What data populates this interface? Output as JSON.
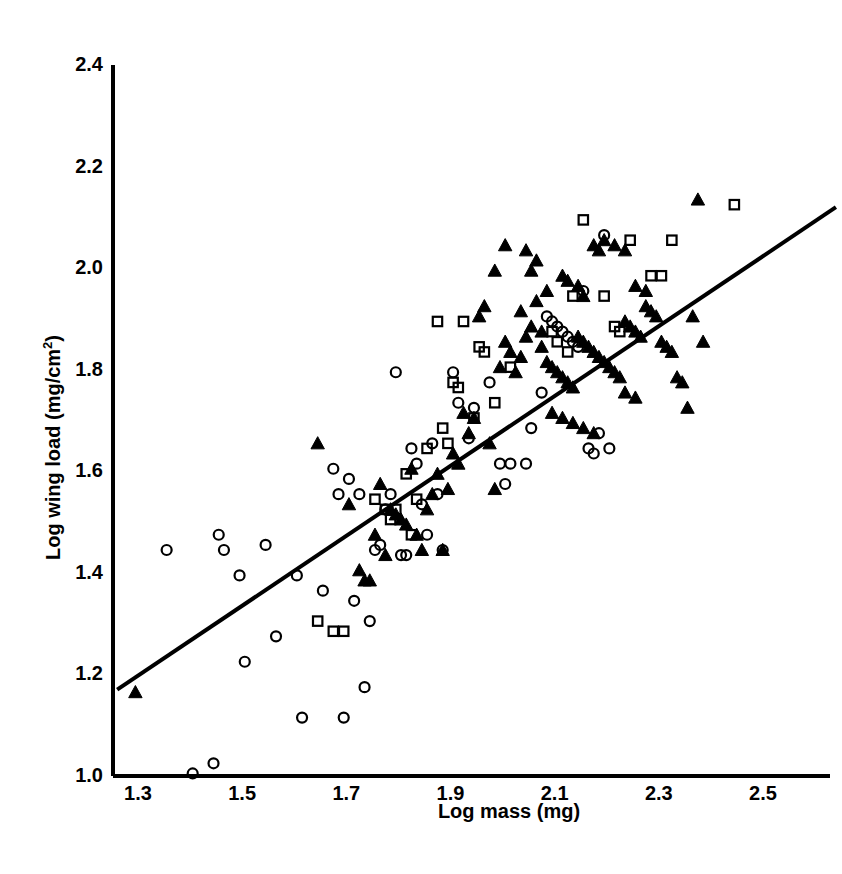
{
  "chart_data": {
    "type": "scatter",
    "title": "",
    "xlabel": "Log mass (mg)",
    "ylabel": "Log wing load (mg/cm2)",
    "ylabel_base": "Log wing load (mg/cm",
    "ylabel_sup": "2",
    "ylabel_tail": ")",
    "xlim": [
      1.26,
      2.64
    ],
    "ylim": [
      1.0,
      2.4
    ],
    "xticks": [
      "1.3",
      "1.5",
      "1.7",
      "1.9",
      "2.1",
      "2.3",
      "2.5"
    ],
    "xtick_values": [
      1.3,
      1.5,
      1.7,
      1.9,
      2.1,
      2.3,
      2.5
    ],
    "yticks": [
      "1.0",
      "1.2",
      "1.4",
      "1.6",
      "1.8",
      "2.0",
      "2.2",
      "2.4"
    ],
    "ytick_values": [
      1.0,
      1.2,
      1.4,
      1.6,
      1.8,
      2.0,
      2.2,
      2.4
    ],
    "grid": false,
    "legend": "none",
    "axis_color": "#000000",
    "marker_color": "#000000",
    "line_color": "#000000",
    "regression_line": {
      "label": "fitted regression line",
      "x0": 1.26,
      "y0": 1.17,
      "x1": 2.64,
      "y1": 2.12,
      "slope": 0.688,
      "intercept": 0.303,
      "width_px": 4
    },
    "series": [
      {
        "name": "open-circle",
        "marker": "circle-open",
        "count": 58,
        "points": [
          [
            1.355,
            1.445
          ],
          [
            1.405,
            1.005
          ],
          [
            1.445,
            1.025
          ],
          [
            1.455,
            1.475
          ],
          [
            1.465,
            1.445
          ],
          [
            1.495,
            1.395
          ],
          [
            1.505,
            1.225
          ],
          [
            1.545,
            1.455
          ],
          [
            1.565,
            1.275
          ],
          [
            1.605,
            1.395
          ],
          [
            1.615,
            1.115
          ],
          [
            1.655,
            1.365
          ],
          [
            1.675,
            1.605
          ],
          [
            1.685,
            1.555
          ],
          [
            1.695,
            1.115
          ],
          [
            1.705,
            1.585
          ],
          [
            1.715,
            1.345
          ],
          [
            1.725,
            1.555
          ],
          [
            1.735,
            1.175
          ],
          [
            1.745,
            1.305
          ],
          [
            1.755,
            1.445
          ],
          [
            1.765,
            1.455
          ],
          [
            1.775,
            1.525
          ],
          [
            1.785,
            1.555
          ],
          [
            1.795,
            1.795
          ],
          [
            1.805,
            1.435
          ],
          [
            1.815,
            1.435
          ],
          [
            1.825,
            1.645
          ],
          [
            1.835,
            1.615
          ],
          [
            1.845,
            1.535
          ],
          [
            1.855,
            1.475
          ],
          [
            1.865,
            1.655
          ],
          [
            1.875,
            1.555
          ],
          [
            1.885,
            1.445
          ],
          [
            1.905,
            1.795
          ],
          [
            1.915,
            1.735
          ],
          [
            1.935,
            1.665
          ],
          [
            1.945,
            1.725
          ],
          [
            1.975,
            1.775
          ],
          [
            1.995,
            1.615
          ],
          [
            2.005,
            1.575
          ],
          [
            2.015,
            1.615
          ],
          [
            2.045,
            1.615
          ],
          [
            2.055,
            1.685
          ],
          [
            2.075,
            1.755
          ],
          [
            2.085,
            1.905
          ],
          [
            2.095,
            1.895
          ],
          [
            2.105,
            1.885
          ],
          [
            2.115,
            1.875
          ],
          [
            2.125,
            1.865
          ],
          [
            2.135,
            1.855
          ],
          [
            2.145,
            1.845
          ],
          [
            2.155,
            1.955
          ],
          [
            2.165,
            1.645
          ],
          [
            2.175,
            1.635
          ],
          [
            2.185,
            1.675
          ],
          [
            2.195,
            2.065
          ],
          [
            2.205,
            1.645
          ]
        ]
      },
      {
        "name": "open-square",
        "marker": "square-open",
        "count": 32,
        "points": [
          [
            1.645,
            1.305
          ],
          [
            1.675,
            1.285
          ],
          [
            1.695,
            1.285
          ],
          [
            1.755,
            1.545
          ],
          [
            1.775,
            1.525
          ],
          [
            1.785,
            1.505
          ],
          [
            1.795,
            1.525
          ],
          [
            1.815,
            1.595
          ],
          [
            1.825,
            1.475
          ],
          [
            1.835,
            1.545
          ],
          [
            1.855,
            1.645
          ],
          [
            1.875,
            1.895
          ],
          [
            1.885,
            1.685
          ],
          [
            1.895,
            1.655
          ],
          [
            1.905,
            1.775
          ],
          [
            1.915,
            1.765
          ],
          [
            1.925,
            1.895
          ],
          [
            1.945,
            1.705
          ],
          [
            1.955,
            1.845
          ],
          [
            1.965,
            1.835
          ],
          [
            1.985,
            1.735
          ],
          [
            2.015,
            1.805
          ],
          [
            2.095,
            1.875
          ],
          [
            2.105,
            1.855
          ],
          [
            2.125,
            1.835
          ],
          [
            2.135,
            1.945
          ],
          [
            2.155,
            2.095
          ],
          [
            2.195,
            1.945
          ],
          [
            2.215,
            1.885
          ],
          [
            2.225,
            1.875
          ],
          [
            2.245,
            2.055
          ],
          [
            2.285,
            1.985
          ],
          [
            2.305,
            1.985
          ],
          [
            2.325,
            2.055
          ],
          [
            2.445,
            2.125
          ]
        ]
      },
      {
        "name": "filled-triangle",
        "marker": "triangle-filled",
        "count": 96,
        "points": [
          [
            1.295,
            1.165
          ],
          [
            1.645,
            1.655
          ],
          [
            1.705,
            1.535
          ],
          [
            1.725,
            1.405
          ],
          [
            1.735,
            1.385
          ],
          [
            1.745,
            1.385
          ],
          [
            1.755,
            1.475
          ],
          [
            1.765,
            1.575
          ],
          [
            1.775,
            1.435
          ],
          [
            1.785,
            1.525
          ],
          [
            1.795,
            1.515
          ],
          [
            1.805,
            1.505
          ],
          [
            1.815,
            1.495
          ],
          [
            1.825,
            1.605
          ],
          [
            1.835,
            1.475
          ],
          [
            1.845,
            1.445
          ],
          [
            1.855,
            1.525
          ],
          [
            1.865,
            1.555
          ],
          [
            1.875,
            1.595
          ],
          [
            1.885,
            1.445
          ],
          [
            1.895,
            1.565
          ],
          [
            1.905,
            1.635
          ],
          [
            1.915,
            1.615
          ],
          [
            1.925,
            1.715
          ],
          [
            1.935,
            1.675
          ],
          [
            1.945,
            1.705
          ],
          [
            1.955,
            1.905
          ],
          [
            1.965,
            1.925
          ],
          [
            1.975,
            1.655
          ],
          [
            1.985,
            1.565
          ],
          [
            1.995,
            1.805
          ],
          [
            2.005,
            1.855
          ],
          [
            2.015,
            1.835
          ],
          [
            2.025,
            1.795
          ],
          [
            2.035,
            1.825
          ],
          [
            2.045,
            1.865
          ],
          [
            2.055,
            1.995
          ],
          [
            2.065,
            1.935
          ],
          [
            2.075,
            1.845
          ],
          [
            2.085,
            1.815
          ],
          [
            2.095,
            1.805
          ],
          [
            2.105,
            1.795
          ],
          [
            2.115,
            1.785
          ],
          [
            2.125,
            1.775
          ],
          [
            2.135,
            1.765
          ],
          [
            2.145,
            1.865
          ],
          [
            2.155,
            1.855
          ],
          [
            2.165,
            1.845
          ],
          [
            2.175,
            1.835
          ],
          [
            2.185,
            1.825
          ],
          [
            2.195,
            1.815
          ],
          [
            2.205,
            1.805
          ],
          [
            2.215,
            1.795
          ],
          [
            2.225,
            1.785
          ],
          [
            2.235,
            1.895
          ],
          [
            2.245,
            1.885
          ],
          [
            2.255,
            1.875
          ],
          [
            2.265,
            1.865
          ],
          [
            2.275,
            1.925
          ],
          [
            2.285,
            1.915
          ],
          [
            2.295,
            1.905
          ],
          [
            2.305,
            1.855
          ],
          [
            2.315,
            1.845
          ],
          [
            2.325,
            1.835
          ],
          [
            2.335,
            1.785
          ],
          [
            2.345,
            1.775
          ],
          [
            2.355,
            1.725
          ],
          [
            2.365,
            1.905
          ],
          [
            2.375,
            2.135
          ],
          [
            2.385,
            1.855
          ],
          [
            2.005,
            2.045
          ],
          [
            2.045,
            2.035
          ],
          [
            2.065,
            2.015
          ],
          [
            2.085,
            1.955
          ],
          [
            2.115,
            1.985
          ],
          [
            2.125,
            1.975
          ],
          [
            2.145,
            1.965
          ],
          [
            2.155,
            1.945
          ],
          [
            2.175,
            2.045
          ],
          [
            2.185,
            2.035
          ],
          [
            2.195,
            2.055
          ],
          [
            2.215,
            2.045
          ],
          [
            2.235,
            2.035
          ],
          [
            2.255,
            1.965
          ],
          [
            2.275,
            1.955
          ],
          [
            1.985,
            1.995
          ],
          [
            2.035,
            1.915
          ],
          [
            2.055,
            1.885
          ],
          [
            2.075,
            1.875
          ],
          [
            2.095,
            1.715
          ],
          [
            2.115,
            1.705
          ],
          [
            2.135,
            1.695
          ],
          [
            2.155,
            1.685
          ],
          [
            2.175,
            1.675
          ],
          [
            2.235,
            1.755
          ],
          [
            2.255,
            1.745
          ]
        ]
      }
    ]
  },
  "plot_geometry": {
    "x_axis_y_px": 776,
    "y_axis_x_px": 113,
    "x_min_px": 113,
    "x_max_px": 830,
    "y_top_px": 65,
    "y_bottom_px": 776,
    "x_at_1_3_px": 138,
    "x_at_2_5_px": 763,
    "axis_line_width": 4,
    "marker_size_px": 11
  }
}
